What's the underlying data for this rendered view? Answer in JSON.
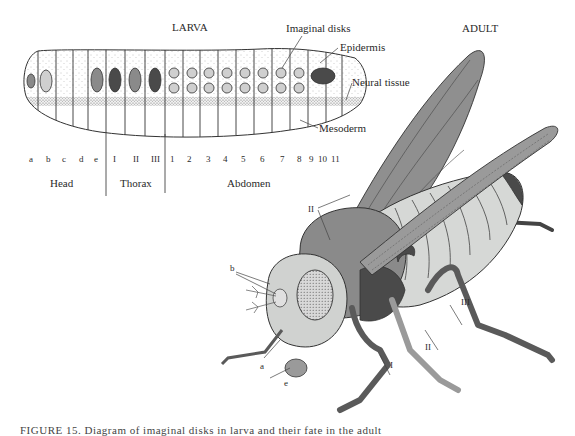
{
  "larva": {
    "title": "LARVA",
    "labels": {
      "imaginal_disks": "Imaginal disks",
      "epidermis": "Epidermis",
      "neural_tissue": "Neural tissue",
      "mesoderm": "Mesoderm"
    },
    "segments": {
      "head": [
        "a",
        "b",
        "c",
        "d",
        "e"
      ],
      "thorax": [
        "I",
        "II",
        "III"
      ],
      "abdomen": [
        "1",
        "2",
        "3",
        "4",
        "5",
        "6",
        "7",
        "8",
        "9",
        "10",
        "11"
      ]
    },
    "regions": {
      "head": "Head",
      "thorax": "Thorax",
      "abdomen": "Abdomen"
    }
  },
  "adult": {
    "title": "ADULT",
    "labels": {
      "wing_segment": "II",
      "head_b": "b",
      "head_a": "a",
      "head_e": "e",
      "leg_1": "I",
      "leg_2": "II",
      "leg_3": "III"
    }
  },
  "colors": {
    "dark_disk": "#4a4a4a",
    "mid_disk": "#8a8a8a",
    "light_disk": "#cfcfcf",
    "wing": "#8f8f8f",
    "thorax": "#8a8a8a",
    "abdomen": "#d6d8d6",
    "leg": "#5a5a5a",
    "head": "#d0d2d0"
  },
  "caption": {
    "text": "FIGURE 15.  Diagram of imaginal disks in larva and their fate in the adult"
  }
}
